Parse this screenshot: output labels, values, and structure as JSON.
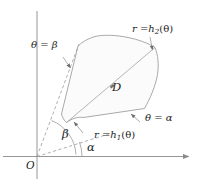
{
  "figure": {
    "type": "polar-region-diagram",
    "colors": {
      "stroke": "#8a8a8a",
      "axis": "#8a8a8a",
      "fill": "#fbfbfb",
      "text": "#1d1d1d"
    }
  },
  "labels": {
    "origin": "O",
    "region": "D",
    "theta_beta": "θ = β",
    "theta_alpha": "θ = α",
    "angle_alpha": "α",
    "angle_beta": "β",
    "r_equals": "r =",
    "h_letter": "h",
    "inner_index": "1",
    "outer_index": "2",
    "theta_arg": "(θ)",
    "curve_inner": "r = h₁(θ)",
    "curve_outer": "r = h₂(θ)"
  },
  "axes": {
    "x_axis": "horizontal axis",
    "y_axis": "vertical axis"
  }
}
